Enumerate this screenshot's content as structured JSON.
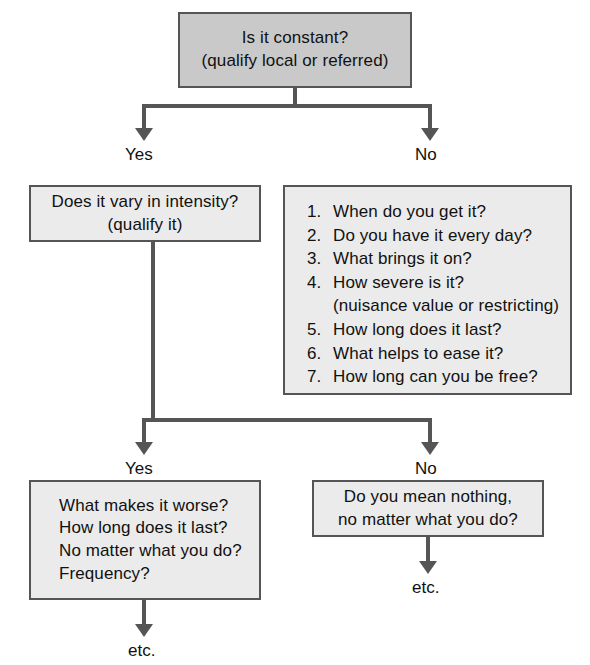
{
  "diagram": {
    "colors": {
      "node_fill_light": "#ebebeb",
      "node_fill_dark": "#c9c9c9",
      "node_border": "#555555",
      "connector": "#555555",
      "text": "#111111",
      "background": "#ffffff"
    },
    "nodes": {
      "root": {
        "line1": "Is it constant?",
        "line2": "(qualify local or referred)"
      },
      "vary_intensity": {
        "line1": "Does it vary in intensity?",
        "line2": "(qualify it)"
      },
      "questions_list": {
        "items": [
          {
            "num": "1.",
            "text": "When do you get it?"
          },
          {
            "num": "2.",
            "text": "Do you have it every day?"
          },
          {
            "num": "3.",
            "text": "What brings it on?"
          },
          {
            "num": "4.",
            "text": "How severe is it?"
          },
          {
            "num": "5.",
            "text": "How long does it last?"
          },
          {
            "num": "6.",
            "text": "What helps to ease it?"
          },
          {
            "num": "7.",
            "text": "How long can you be free?"
          }
        ],
        "sub_item_4": "(nuisance value or restricting)"
      },
      "yes_detail": {
        "line1": "What makes it worse?",
        "line2": "How long does it last?",
        "line3": "No matter what you do?",
        "line4": "Frequency?"
      },
      "no_detail": {
        "line1": "Do you mean nothing,",
        "line2": "no matter what you do?"
      }
    },
    "edge_labels": {
      "root_yes": "Yes",
      "root_no": "No",
      "second_yes": "Yes",
      "second_no": "No"
    },
    "terminals": {
      "left_etc": "etc.",
      "right_etc": "etc."
    }
  }
}
